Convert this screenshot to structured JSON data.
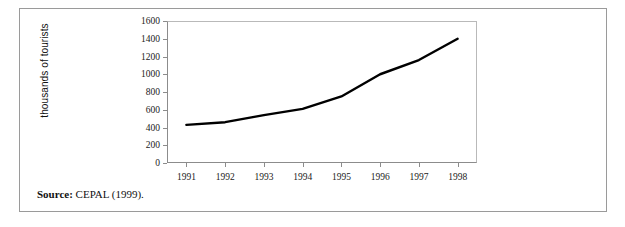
{
  "figure": {
    "source_label": "Source:",
    "source_text": "CEPAL (1999)."
  },
  "chart_data": {
    "type": "line",
    "title": "",
    "xlabel": "",
    "ylabel": "thousands of tourists",
    "categories": [
      "1991",
      "1992",
      "1993",
      "1994",
      "1995",
      "1996",
      "1997",
      "1998"
    ],
    "values": [
      430,
      460,
      540,
      610,
      750,
      1000,
      1160,
      1400
    ],
    "series": [
      {
        "name": "thousands of tourists",
        "values": [
          430,
          460,
          540,
          610,
          750,
          1000,
          1160,
          1400
        ]
      }
    ],
    "ylim": [
      0,
      1600
    ],
    "yticks": [
      0,
      200,
      400,
      600,
      800,
      1000,
      1200,
      1400,
      1600
    ],
    "ytick_labels": [
      "0",
      "200",
      "400",
      "600",
      "800",
      "1000",
      "1200",
      "1400",
      "1600"
    ],
    "grid": false,
    "legend": false,
    "line_color": "#000000",
    "line_width": 2.4
  }
}
